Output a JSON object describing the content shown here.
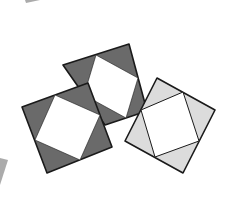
{
  "diagram": {
    "colors": {
      "dark_fill": "#6a6a6a",
      "light_fill": "#dcdcdc",
      "inner_fill": "#ffffff",
      "stroke": "#1a1a1a"
    },
    "squares": [
      {
        "id": "back-dark-square",
        "outer": [
          [
            63,
            65
          ],
          [
            129,
            44
          ],
          [
            147,
            111
          ],
          [
            105,
            125
          ]
        ],
        "inner": [
          [
            96,
            55
          ],
          [
            138,
            78
          ],
          [
            126,
            118
          ],
          [
            84,
            95
          ]
        ],
        "fill": "dark"
      },
      {
        "id": "front-left-dark-square",
        "outer": [
          [
            22,
            107
          ],
          [
            88,
            83
          ],
          [
            112,
            147
          ],
          [
            47,
            173
          ]
        ],
        "inner": [
          [
            55,
            95
          ],
          [
            100,
            115
          ],
          [
            80,
            160
          ],
          [
            35,
            140
          ]
        ],
        "fill": "dark"
      },
      {
        "id": "right-light-square",
        "outer": [
          [
            157,
            78
          ],
          [
            215,
            110
          ],
          [
            183,
            173
          ],
          [
            125,
            141
          ]
        ],
        "inner": [
          [
            183,
            92
          ],
          [
            199,
            141
          ],
          [
            155,
            157
          ],
          [
            141,
            110
          ]
        ],
        "fill": "light"
      }
    ],
    "edge_artifacts": [
      {
        "id": "top-left-fragment",
        "points": [
          [
            25,
            0
          ],
          [
            40,
            0
          ],
          [
            26,
            3
          ]
        ]
      },
      {
        "id": "bottom-left-fragment",
        "points": [
          [
            0,
            158
          ],
          [
            8,
            160
          ],
          [
            0,
            185
          ]
        ]
      }
    ]
  }
}
